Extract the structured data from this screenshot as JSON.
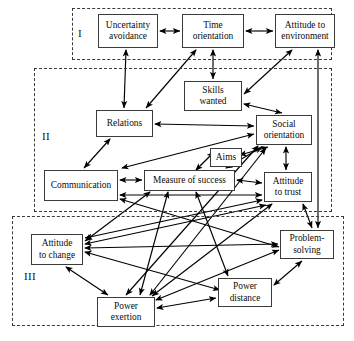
{
  "diagram": {
    "type": "node-link-diagram",
    "background": "#ffffff",
    "node_border_color": "#3b3b3b",
    "region_border_color": "#3a3a3a",
    "arrow_color": "#000000",
    "regions": [
      {
        "id": "I",
        "label": "I",
        "x": 72,
        "y": 8,
        "w": 260,
        "h": 52,
        "label_x": 78,
        "label_y": 27
      },
      {
        "id": "II",
        "label": "II",
        "x": 34,
        "y": 68,
        "w": 298,
        "h": 144,
        "label_x": 42,
        "label_y": 130
      },
      {
        "id": "III",
        "label": "III",
        "x": 12,
        "y": 216,
        "w": 332,
        "h": 110,
        "label_x": 24,
        "label_y": 270
      }
    ],
    "nodes": [
      {
        "id": "uncertainty_avoidance",
        "label": "Uncertainty\navoidance",
        "x": 98,
        "y": 14,
        "w": 60,
        "h": 34
      },
      {
        "id": "time_orientation",
        "label": "Time\norientation",
        "x": 182,
        "y": 14,
        "w": 62,
        "h": 34
      },
      {
        "id": "attitude_environment",
        "label": "Attitude to\nenvironment",
        "x": 275,
        "y": 14,
        "w": 60,
        "h": 34
      },
      {
        "id": "skills_wanted",
        "label": "Skills\nwanted",
        "x": 184,
        "y": 81,
        "w": 58,
        "h": 30
      },
      {
        "id": "relations",
        "label": "Relations",
        "x": 96,
        "y": 110,
        "w": 57,
        "h": 27
      },
      {
        "id": "social_orientation",
        "label": "Social\norientation",
        "x": 256,
        "y": 115,
        "w": 56,
        "h": 30
      },
      {
        "id": "aims",
        "label": "Aims",
        "x": 210,
        "y": 148,
        "w": 32,
        "h": 19
      },
      {
        "id": "communication",
        "label": "Communication",
        "x": 44,
        "y": 170,
        "w": 74,
        "h": 31
      },
      {
        "id": "measure_of_success",
        "label": "Measure of success",
        "x": 144,
        "y": 170,
        "w": 91,
        "h": 21
      },
      {
        "id": "attitude_to_trust",
        "label": "Attitude\nto trust",
        "x": 264,
        "y": 172,
        "w": 48,
        "h": 30
      },
      {
        "id": "attitude_to_change",
        "label": "Attitude\nto change",
        "x": 31,
        "y": 234,
        "w": 52,
        "h": 31
      },
      {
        "id": "problem_solving",
        "label": "Problem-\nsolving",
        "x": 280,
        "y": 230,
        "w": 54,
        "h": 29
      },
      {
        "id": "power_distance",
        "label": "Power\ndistance",
        "x": 218,
        "y": 278,
        "w": 54,
        "h": 29
      },
      {
        "id": "power_exertion",
        "label": "Power\nexertion",
        "x": 97,
        "y": 297,
        "w": 58,
        "h": 30
      }
    ],
    "edges": [
      {
        "from": "uncertainty_avoidance",
        "to": "time_orientation",
        "heads": "both",
        "x1": 160,
        "y1": 31,
        "x2": 180,
        "y2": 31
      },
      {
        "from": "time_orientation",
        "to": "attitude_environment",
        "heads": "both",
        "x1": 246,
        "y1": 31,
        "x2": 273,
        "y2": 31
      },
      {
        "from": "uncertainty_avoidance",
        "to": "relations",
        "heads": "both",
        "x1": 126,
        "y1": 50,
        "x2": 124,
        "y2": 108
      },
      {
        "from": "time_orientation",
        "to": "skills_wanted",
        "heads": "both",
        "x1": 213,
        "y1": 50,
        "x2": 213,
        "y2": 79
      },
      {
        "from": "time_orientation",
        "to": "relations",
        "heads": "both",
        "x1": 196,
        "y1": 50,
        "x2": 146,
        "y2": 108
      },
      {
        "from": "attitude_environment",
        "to": "skills_wanted",
        "heads": "both",
        "x1": 292,
        "y1": 50,
        "x2": 244,
        "y2": 94
      },
      {
        "from": "skills_wanted",
        "to": "social_orientation",
        "heads": "both",
        "x1": 244,
        "y1": 104,
        "x2": 282,
        "y2": 113
      },
      {
        "from": "relations",
        "to": "social_orientation",
        "heads": "both",
        "x1": 155,
        "y1": 124,
        "x2": 254,
        "y2": 126
      },
      {
        "from": "relations",
        "to": "communication",
        "heads": "both",
        "x1": 110,
        "y1": 139,
        "x2": 84,
        "y2": 168
      },
      {
        "from": "communication",
        "to": "measure_of_success",
        "heads": "both",
        "x1": 120,
        "y1": 180,
        "x2": 142,
        "y2": 180
      },
      {
        "from": "measure_of_success",
        "to": "attitude_to_trust",
        "heads": "both",
        "x1": 237,
        "y1": 180,
        "x2": 262,
        "y2": 183
      },
      {
        "from": "measure_of_success",
        "to": "aims",
        "heads": "both",
        "x1": 196,
        "y1": 170,
        "x2": 214,
        "y2": 152
      },
      {
        "from": "aims",
        "to": "social_orientation",
        "heads": "both",
        "x1": 240,
        "y1": 155,
        "x2": 268,
        "y2": 147
      },
      {
        "from": "measure_of_success",
        "to": "social_orientation",
        "heads": "both",
        "x1": 226,
        "y1": 168,
        "x2": 262,
        "y2": 147
      },
      {
        "from": "communication",
        "to": "social_orientation",
        "heads": "both",
        "x1": 122,
        "y1": 168,
        "x2": 254,
        "y2": 134
      },
      {
        "from": "social_orientation",
        "to": "attitude_to_trust",
        "heads": "both",
        "x1": 286,
        "y1": 147,
        "x2": 286,
        "y2": 170
      },
      {
        "from": "attitude_to_trust",
        "to": "problem_solving",
        "heads": "both",
        "x1": 303,
        "y1": 204,
        "x2": 312,
        "y2": 228
      },
      {
        "from": "communication",
        "to": "attitude_to_trust",
        "heads": "both",
        "x1": 120,
        "y1": 195,
        "x2": 262,
        "y2": 195
      },
      {
        "from": "attitude_to_change",
        "to": "problem_solving",
        "heads": "both",
        "x1": 85,
        "y1": 248,
        "x2": 278,
        "y2": 244
      },
      {
        "from": "attitude_to_change",
        "to": "power_exertion",
        "heads": "both",
        "x1": 66,
        "y1": 267,
        "x2": 108,
        "y2": 295
      },
      {
        "from": "power_exertion",
        "to": "power_distance",
        "heads": "both",
        "x1": 157,
        "y1": 308,
        "x2": 216,
        "y2": 298
      },
      {
        "from": "power_distance",
        "to": "problem_solving",
        "heads": "both",
        "x1": 274,
        "y1": 285,
        "x2": 302,
        "y2": 261
      },
      {
        "from": "attitude_to_trust",
        "to": "attitude_to_change",
        "heads": "both",
        "x1": 262,
        "y1": 200,
        "x2": 85,
        "y2": 238
      },
      {
        "from": "measure_of_success",
        "to": "attitude_to_change",
        "heads": "both",
        "x1": 150,
        "y1": 192,
        "x2": 85,
        "y2": 241
      },
      {
        "from": "social_orientation",
        "to": "power_exertion",
        "heads": "both",
        "x1": 258,
        "y1": 146,
        "x2": 126,
        "y2": 295
      },
      {
        "from": "measure_of_success",
        "to": "power_exertion",
        "heads": "both",
        "x1": 168,
        "y1": 192,
        "x2": 140,
        "y2": 295
      },
      {
        "from": "measure_of_success",
        "to": "power_distance",
        "heads": "both",
        "x1": 196,
        "y1": 192,
        "x2": 228,
        "y2": 276
      },
      {
        "from": "attitude_to_trust",
        "to": "power_exertion",
        "heads": "both",
        "x1": 272,
        "y1": 204,
        "x2": 152,
        "y2": 296
      },
      {
        "from": "attitude_to_change",
        "to": "power_distance",
        "heads": "both",
        "x1": 85,
        "y1": 252,
        "x2": 220,
        "y2": 290
      },
      {
        "from": "attitude_to_change",
        "to": "attitude_to_trust",
        "heads": "both",
        "x1": 85,
        "y1": 244,
        "x2": 266,
        "y2": 205
      },
      {
        "from": "power_exertion",
        "to": "social_orientation",
        "heads": "both",
        "x1": 150,
        "y1": 295,
        "x2": 266,
        "y2": 148
      },
      {
        "from": "power_exertion",
        "to": "problem_solving",
        "heads": "both",
        "x1": 156,
        "y1": 300,
        "x2": 279,
        "y2": 250
      },
      {
        "from": "communication",
        "to": "problem_solving",
        "heads": "both",
        "x1": 120,
        "y1": 199,
        "x2": 279,
        "y2": 247
      },
      {
        "from": "attitude_environment",
        "to": "problem_solving",
        "heads": "both",
        "x1": 318,
        "y1": 50,
        "x2": 318,
        "y2": 228
      }
    ]
  }
}
